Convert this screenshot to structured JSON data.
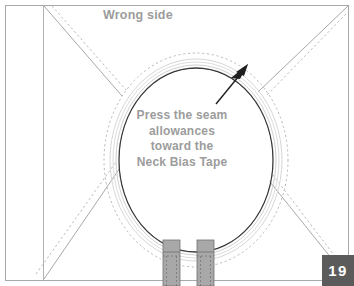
{
  "figure": {
    "title_label": "Wrong side",
    "page_number": "19",
    "instruction_lines": [
      "Press the seam",
      "allowances",
      "toward the",
      "Neck Bias Tape"
    ],
    "colors": {
      "frame_border": "#a9a9a9",
      "fabric_fold_line": "#b3b3b3",
      "neckline_seam": "#3a3a3a",
      "bias_tape_band": "#d6d6d6",
      "stitch_dashed": "#b0b0b0",
      "diagonal_solid": "#9e9e9e",
      "tape_strip_fill": "#a8a8a8",
      "tape_strip_stroke": "#707070",
      "arrow": "#1f1f1f",
      "text_gray": "#9c9c9c",
      "badge_bg": "#5b5b5b",
      "badge_text": "#ffffff"
    },
    "elements": {
      "frame_name": "garment-panel-frame",
      "fold_line_name": "center-fold-line",
      "neckline_name": "neckline-seam-curve",
      "bias_tape_name": "neck-bias-tape-band",
      "stitch_line_name": "stitching-dashed-line",
      "arrow_name": "pointer-arrow",
      "left_tape_name": "bias-tape-end-left",
      "right_tape_name": "bias-tape-end-right",
      "diagonals_name": "shoulder-seam-diagonals"
    }
  }
}
